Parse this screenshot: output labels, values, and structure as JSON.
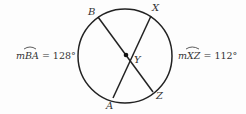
{
  "diagram": {
    "points": {
      "B": "B",
      "X": "X",
      "Y": "Y",
      "A": "A",
      "Z": "Z"
    },
    "left_measure": {
      "prefix": "m",
      "arc": "BA",
      "equals": " = ",
      "value": "128°"
    },
    "right_measure": {
      "prefix": "m",
      "arc": "XZ",
      "equals": " = ",
      "value": "112°"
    },
    "colors": {
      "stroke": "#222222",
      "text": "#333333"
    }
  }
}
